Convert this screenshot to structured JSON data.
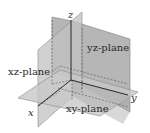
{
  "diagram": {
    "type": "3d-coordinate-planes",
    "axes": {
      "x": {
        "label": "x"
      },
      "y": {
        "label": "y"
      },
      "z": {
        "label": "z"
      }
    },
    "planes": [
      {
        "id": "yz",
        "label": "yz-plane",
        "color": "#a9a9a9"
      },
      {
        "id": "xz",
        "label": "xz-plane",
        "color": "#bdbdbd"
      },
      {
        "id": "xy",
        "label": "xy-plane",
        "color": "#c4c4c4"
      }
    ],
    "colors": {
      "background": "#ffffff",
      "axis": "#1a1a1a",
      "dashed": "#555555",
      "edge": "#777777",
      "label": "#2a2a2a"
    }
  }
}
